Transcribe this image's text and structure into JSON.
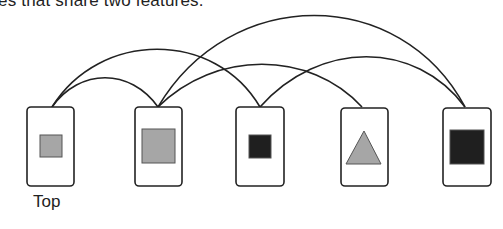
{
  "caption": "es that share two features.",
  "colors": {
    "stroke": "#222222",
    "card_fill": "#ffffff",
    "light_gray": "#a6a6a6",
    "dark": "#1f1f1f"
  },
  "cards": [
    {
      "id": "card-1",
      "x": 27,
      "y": 107,
      "w": 47,
      "h": 79,
      "shape": "square",
      "size": "small",
      "fill": "light_gray",
      "label": "Top",
      "sx": 40,
      "sy": 135,
      "sw": 22,
      "sh": 22
    },
    {
      "id": "card-2",
      "x": 135,
      "y": 107,
      "w": 47,
      "h": 79,
      "shape": "square",
      "size": "large",
      "fill": "light_gray",
      "sx": 142,
      "sy": 129,
      "sw": 33,
      "sh": 34
    },
    {
      "id": "card-3",
      "x": 236,
      "y": 107,
      "w": 48,
      "h": 79,
      "shape": "square",
      "size": "small",
      "fill": "dark",
      "sx": 249,
      "sy": 135,
      "sw": 22,
      "sh": 23
    },
    {
      "id": "card-4",
      "x": 341,
      "y": 108,
      "w": 47,
      "h": 78,
      "shape": "triangle",
      "size": "large",
      "fill": "light_gray",
      "points": "364,131 346,164 381,164"
    },
    {
      "id": "card-5",
      "x": 443,
      "y": 108,
      "w": 48,
      "h": 78,
      "shape": "square",
      "size": "large",
      "fill": "dark",
      "sx": 450,
      "sy": 130,
      "sw": 34,
      "sh": 34
    }
  ],
  "links": [
    {
      "from": "card-1",
      "to": "card-2",
      "d": "M52,107 C80,68 130,68 158,107"
    },
    {
      "from": "card-1",
      "to": "card-3",
      "d": "M52,107 C100,30 215,30 260,107"
    },
    {
      "from": "card-2",
      "to": "card-4",
      "d": "M158,107 C215,50 310,50 362,107"
    },
    {
      "from": "card-2",
      "to": "card-5",
      "d": "M158,107 C230,-15 400,-15 465,107"
    },
    {
      "from": "card-3",
      "to": "card-5",
      "d": "M260,107 C320,40 415,40 465,107"
    }
  ],
  "labels": {
    "top": "Top"
  }
}
